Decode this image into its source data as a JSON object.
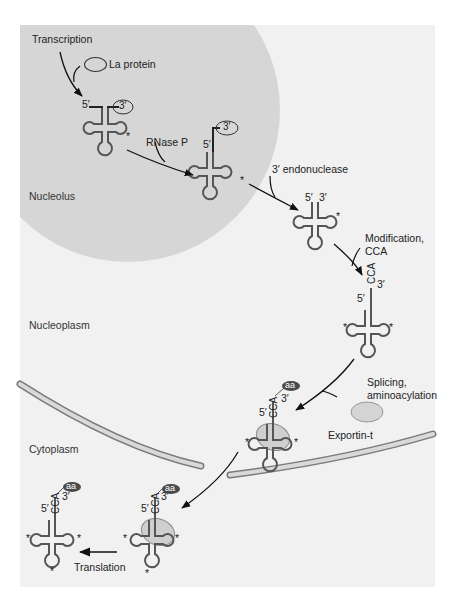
{
  "figure": {
    "type": "tRNA processing pathway",
    "colors": {
      "panel_bg": "#f1f1f1",
      "nucleolus": "#d6d6d6",
      "membrane_fill": "#d9d9d9",
      "membrane_stroke": "#7a7a7a",
      "trna_stroke": "#555555",
      "exportin": "#cfcfcf",
      "aa_badge": "#4a4a4a",
      "arrow": "#111111"
    }
  },
  "regions": {
    "nucleolus": "Nucleolus",
    "nucleoplasm": "Nucleoplasm",
    "cytoplasm": "Cytoplasm"
  },
  "steps": {
    "transcription": "Transcription",
    "la_protein": "La protein",
    "rnase_p": "RNase P",
    "endonuclease": "3′ endonuclease",
    "modification_line1": "Modification,",
    "modification_line2": "CCA",
    "splicing_line1": "Splicing,",
    "splicing_line2": "aminoacylation",
    "exportin": "Exportin-t",
    "translation": "Translation"
  },
  "trna_labels": {
    "five_prime": "5′",
    "three_prime": "3′",
    "cca": "CCA",
    "aa": "aa",
    "star": "*"
  }
}
